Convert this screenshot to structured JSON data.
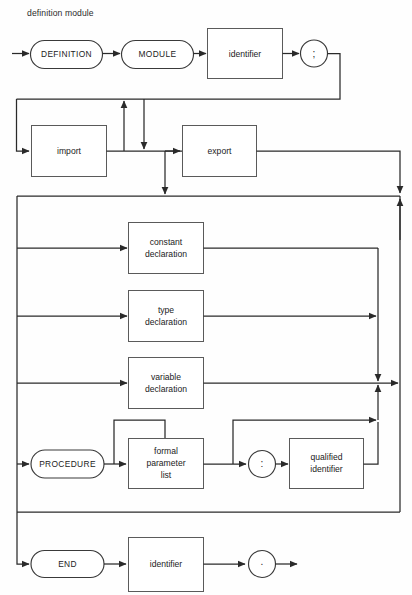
{
  "diagram": {
    "title": "definition module",
    "type": "syntax-railroad-diagram",
    "nodes": {
      "definition_keyword": "DEFINITION",
      "module_keyword": "MODULE",
      "module_name_identifier": "identifier",
      "semicolon_symbol": ";",
      "import_rule": "import",
      "export_rule": "export",
      "constant_declaration_rule": "constant\ndeclaration",
      "constant_declaration_line1": "constant",
      "constant_declaration_line2": "declaration",
      "type_declaration_line1": "type",
      "type_declaration_line2": "declaration",
      "variable_declaration_line1": "variable",
      "variable_declaration_line2": "declaration",
      "procedure_keyword": "PROCEDURE",
      "formal_parameter_list_line1": "formal",
      "formal_parameter_list_line2": "parameter",
      "formal_parameter_list_line3": "list",
      "colon_symbol": ":",
      "qualified_identifier_line1": "qualified",
      "qualified_identifier_line2": "identifier",
      "end_keyword": "END",
      "end_name_identifier": "identifier",
      "period_symbol": "."
    },
    "colors": {
      "background": "#fefefe",
      "line": "#2a2a2a",
      "box_stroke": "#5a5a5a",
      "pill_stroke": "#3a3a3a",
      "text": "#222222"
    }
  }
}
